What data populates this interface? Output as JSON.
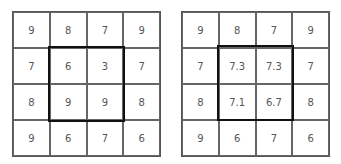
{
  "grids": [
    {
      "name": "input-grid",
      "cells": [
        [
          "9",
          "8",
          "7",
          "9"
        ],
        [
          "7",
          "6",
          "3",
          "7"
        ],
        [
          "8",
          "9",
          "9",
          "8"
        ],
        [
          "9",
          "6",
          "7",
          "6"
        ]
      ]
    },
    {
      "name": "output-grid",
      "cells": [
        [
          "9",
          "8",
          "7",
          "9"
        ],
        [
          "7",
          "7.3",
          "7.3",
          "7"
        ],
        [
          "8",
          "7.1",
          "6.7",
          "8"
        ],
        [
          "9",
          "6",
          "7",
          "6"
        ]
      ]
    }
  ],
  "highlight": {
    "rows": [
      1,
      2
    ],
    "cols": [
      1,
      2
    ],
    "color": "#111111"
  }
}
